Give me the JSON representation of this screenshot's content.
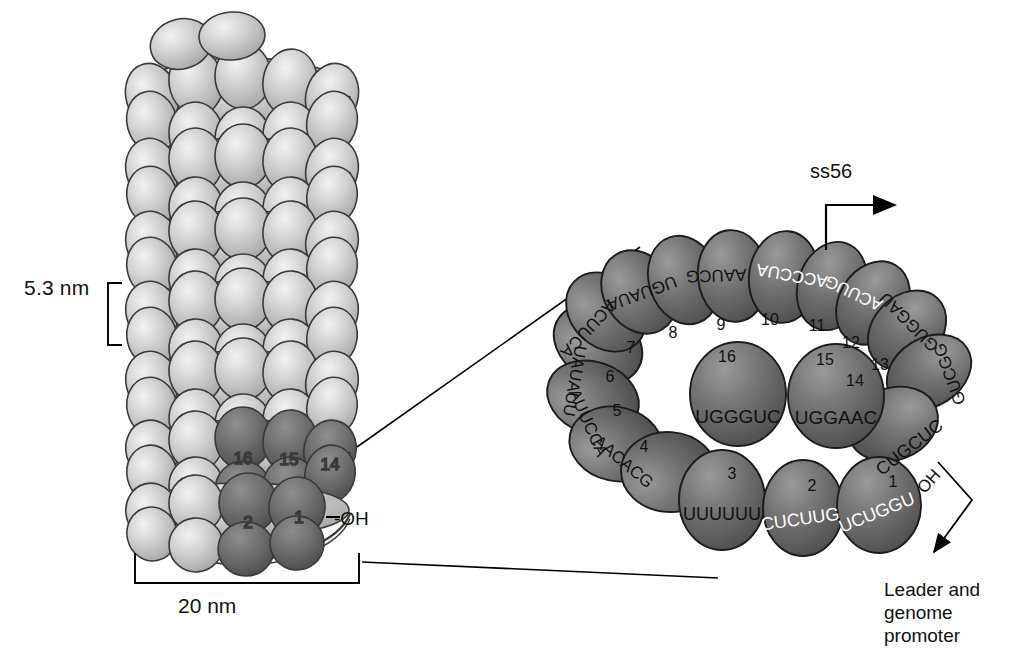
{
  "figure": {
    "kind": "schematic-diagram"
  },
  "left_panel": {
    "name": "helical-rod-assembly",
    "scale_vertical": "5.3 nm",
    "scale_horizontal": "20 nm",
    "terminus_label": "-OH",
    "highlighted_subunit_numbers": [
      "16",
      "15",
      "14",
      "2",
      "1"
    ],
    "subunit_light_color": "#c6c6c6",
    "subunit_dark_color": "#6e6e6e",
    "outline_color": "#3a3a3a"
  },
  "right_panel": {
    "name": "disc-ring-top-view",
    "ss56_label": "ss56",
    "leader_label": "Leader and\ngenome\npromoter",
    "oh_label": "OH",
    "ring_fill": "#6f6f6f",
    "ring_outline": "#1c1c1c",
    "subunits": [
      {
        "number": "1",
        "sequence": "UCUGGU",
        "text_color": "#ffffff"
      },
      {
        "number": "2",
        "sequence": "CUCUUG",
        "text_color": "#ffffff"
      },
      {
        "number": "3",
        "sequence": "UUUUUU",
        "text_color": "#111111"
      },
      {
        "number": "4",
        "sequence": "AACACG",
        "text_color": "#111111"
      },
      {
        "number": "5",
        "sequence": "AUUCCA",
        "text_color": "#111111"
      },
      {
        "number": "6",
        "sequence": "UAUAUU",
        "text_color": "#111111"
      },
      {
        "number": "7",
        "sequence": "ACUUCA",
        "text_color": "#111111"
      },
      {
        "number": "8",
        "sequence": "UGUAUA",
        "text_color": "#111111"
      },
      {
        "number": "9",
        "sequence": "AAUCG",
        "text_color": "#111111"
      },
      {
        "number": "10",
        "sequence": "ACCCUA",
        "text_color": "#ffffff"
      },
      {
        "number": "11",
        "sequence": "ACUUG",
        "text_color": "#ffffff"
      },
      {
        "number": "12",
        "sequence": "GUGGAU",
        "text_color": "#111111"
      },
      {
        "number": "13",
        "sequence": "GUCGG",
        "text_color": "#111111"
      },
      {
        "number": "14",
        "sequence": "CUGCUC",
        "text_color": "#111111"
      },
      {
        "number": "15",
        "sequence": "UGGAAC",
        "text_color": "#111111"
      },
      {
        "number": "16",
        "sequence": "UGGGUC",
        "text_color": "#111111"
      }
    ]
  }
}
